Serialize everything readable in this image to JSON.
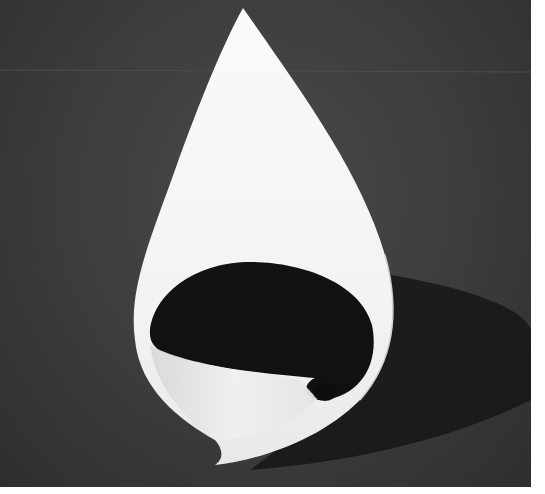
{
  "image": {
    "subject": "white curled paper sculpture shaped like a teardrop",
    "alt": "White paper sheet rolled into a teardrop form on a dark grey background",
    "colors": {
      "background": "#3c3c3c",
      "paper": "#f4f4f2",
      "inner_shadow": "#111111",
      "cast_shadow": "#1e1e1e",
      "border": "#ffffff"
    }
  }
}
